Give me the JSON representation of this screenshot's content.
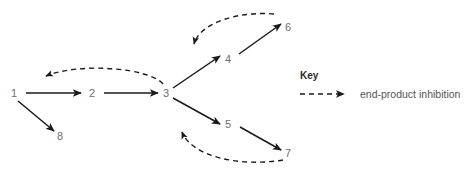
{
  "diagram": {
    "type": "metabolic-pathway",
    "background_color": "#ffffff",
    "node_color": "#6e6e6e",
    "arrow_color": "#1a1a1a",
    "nodes": [
      {
        "id": "1",
        "label": "1",
        "x": 14,
        "y": 93
      },
      {
        "id": "2",
        "label": "2",
        "x": 92,
        "y": 93
      },
      {
        "id": "3",
        "label": "3",
        "x": 166,
        "y": 93
      },
      {
        "id": "4",
        "label": "4",
        "x": 228,
        "y": 59
      },
      {
        "id": "5",
        "label": "5",
        "x": 228,
        "y": 124
      },
      {
        "id": "6",
        "label": "6",
        "x": 288,
        "y": 27
      },
      {
        "id": "7",
        "label": "7",
        "x": 288,
        "y": 153
      },
      {
        "id": "8",
        "label": "8",
        "x": 60,
        "y": 136
      }
    ],
    "solid_arrows": [
      {
        "from": "1",
        "to": "2"
      },
      {
        "from": "2",
        "to": "3"
      },
      {
        "from": "1",
        "to": "8"
      },
      {
        "from": "3",
        "to": "4"
      },
      {
        "from": "3",
        "to": "5"
      },
      {
        "from": "4",
        "to": "6"
      },
      {
        "from": "5",
        "to": "7"
      }
    ],
    "dashed_arrows": [
      {
        "from": "3",
        "to": "1-2",
        "meaning": "end-product inhibition"
      },
      {
        "from": "6",
        "to": "3-4",
        "meaning": "end-product inhibition"
      },
      {
        "from": "7",
        "to": "3-5",
        "meaning": "end-product inhibition"
      }
    ]
  },
  "legend": {
    "title": "Key",
    "entries": [
      {
        "style": "dashed-arrow",
        "label": "end-product inhibition"
      }
    ]
  }
}
